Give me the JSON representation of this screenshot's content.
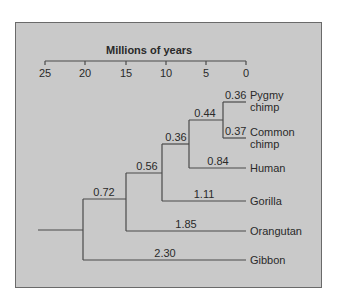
{
  "diagram": {
    "type": "phylogenetic-tree",
    "axis": {
      "title": "Millions of years",
      "ticks": [
        "25",
        "20",
        "15",
        "10",
        "5",
        "0"
      ]
    },
    "taxa": [
      {
        "name_line1": "Pygmy",
        "name_line2": "chimp",
        "branch_length": "0.36"
      },
      {
        "name_line1": "Common",
        "name_line2": "chimp",
        "branch_length": "0.37"
      },
      {
        "name_line1": "Human",
        "branch_length": "0.84"
      },
      {
        "name_line1": "Gorilla",
        "branch_length": "1.11"
      },
      {
        "name_line1": "Orangutan",
        "branch_length": "1.85"
      },
      {
        "name_line1": "Gibbon",
        "branch_length": "2.30"
      }
    ],
    "internal_branches": {
      "chimps_node": "0.44",
      "chimp_human_node": "0.36",
      "african_ape_node": "0.56",
      "great_ape_node": "0.72"
    },
    "colors": {
      "panel_bg": "#c9c9c9",
      "line": "#4a4a4a",
      "text": "#2a2a2a"
    }
  }
}
